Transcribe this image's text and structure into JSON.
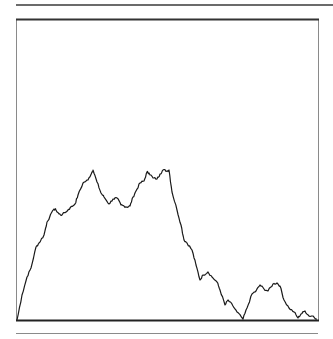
{
  "chart_data": {
    "type": "line",
    "title": "",
    "xlabel": "",
    "ylabel": "",
    "grid": false,
    "legend": "none",
    "xlim": [
      0,
      300
    ],
    "ylim": [
      0,
      300
    ],
    "colors": {
      "line": "#1a1a1a",
      "frame": "#8a8a8a",
      "axis": "#222222"
    },
    "series": [
      {
        "name": "walk",
        "points": [
          [
            0,
            0
          ],
          [
            5,
            25
          ],
          [
            10,
            43
          ],
          [
            14,
            52
          ],
          [
            19,
            73
          ],
          [
            22,
            77
          ],
          [
            27,
            85
          ],
          [
            30,
            98
          ],
          [
            37,
            111
          ],
          [
            39,
            110
          ],
          [
            42,
            106
          ],
          [
            45,
            105
          ],
          [
            51,
            110
          ],
          [
            53,
            112
          ],
          [
            58,
            116
          ],
          [
            61,
            125
          ],
          [
            66,
            137
          ],
          [
            71,
            140
          ],
          [
            75,
            148
          ],
          [
            76,
            150
          ],
          [
            80,
            138
          ],
          [
            84,
            127
          ],
          [
            87,
            123
          ],
          [
            92,
            116
          ],
          [
            96,
            121
          ],
          [
            100,
            122
          ],
          [
            104,
            115
          ],
          [
            107,
            114
          ],
          [
            110,
            113
          ],
          [
            113,
            114
          ],
          [
            116,
            123
          ],
          [
            119,
            129
          ],
          [
            123,
            137
          ],
          [
            127,
            139
          ],
          [
            130,
            148
          ],
          [
            132,
            147
          ],
          [
            136,
            142
          ],
          [
            140,
            141
          ],
          [
            143,
            146
          ],
          [
            146,
            150
          ],
          [
            150,
            149
          ],
          [
            152,
            150
          ],
          [
            155,
            128
          ],
          [
            160,
            110
          ],
          [
            164,
            95
          ],
          [
            167,
            80
          ],
          [
            170,
            77
          ],
          [
            175,
            70
          ],
          [
            179,
            55
          ],
          [
            183,
            40
          ],
          [
            186,
            45
          ],
          [
            191,
            48
          ],
          [
            195,
            43
          ],
          [
            200,
            38
          ],
          [
            203,
            30
          ],
          [
            208,
            15
          ],
          [
            211,
            20
          ],
          [
            216,
            14
          ],
          [
            220,
            8
          ],
          [
            226,
            1
          ],
          [
            230,
            12
          ],
          [
            235,
            26
          ],
          [
            239,
            29
          ],
          [
            243,
            35
          ],
          [
            247,
            31
          ],
          [
            251,
            29
          ],
          [
            256,
            36
          ],
          [
            260,
            37
          ],
          [
            263,
            34
          ],
          [
            267,
            20
          ],
          [
            272,
            12
          ],
          [
            277,
            8
          ],
          [
            281,
            2
          ],
          [
            284,
            6
          ],
          [
            288,
            9
          ],
          [
            292,
            4
          ],
          [
            296,
            4
          ],
          [
            300,
            1
          ]
        ]
      }
    ]
  }
}
